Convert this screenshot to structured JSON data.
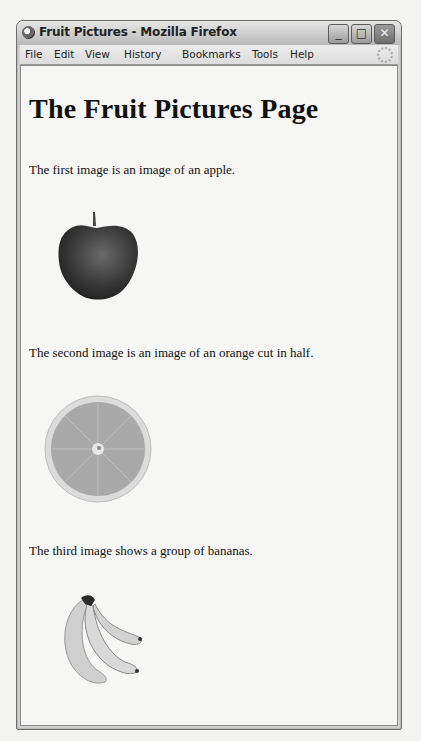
{
  "window": {
    "title": "Fruit Pictures - Mozilla Firefox",
    "controls": {
      "minimize": "_",
      "maximize": "□",
      "close": "✕"
    }
  },
  "menubar": {
    "items": [
      {
        "label": "File",
        "mnemonic": "F"
      },
      {
        "label": "Edit",
        "mnemonic": "E"
      },
      {
        "label": "View",
        "mnemonic": "V"
      },
      {
        "label": "History",
        "mnemonic": "s"
      },
      {
        "label": "Bookmarks",
        "mnemonic": "B"
      },
      {
        "label": "Tools",
        "mnemonic": "T"
      },
      {
        "label": "Help",
        "mnemonic": "H"
      }
    ]
  },
  "page": {
    "heading": "The Fruit Pictures Page",
    "paragraphs": [
      "The first image is an image of an apple.",
      "The second image is an image of an orange cut in half.",
      "The third image shows a group of bananas."
    ],
    "images": [
      {
        "name": "apple",
        "alt": "apple"
      },
      {
        "name": "orange",
        "alt": "orange cut in half"
      },
      {
        "name": "bananas",
        "alt": "bananas"
      }
    ]
  }
}
